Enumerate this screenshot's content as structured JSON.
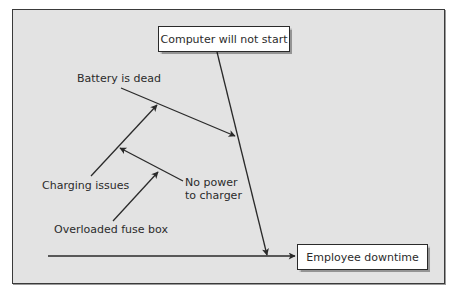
{
  "diagram": {
    "type": "cause-and-effect",
    "title": "",
    "effect_box": {
      "label": "Employee downtime"
    },
    "primary_cause_box": {
      "label": "Computer will not start"
    },
    "causes": [
      {
        "id": "battery",
        "label": "Battery is dead",
        "points_to": "Computer will not start"
      },
      {
        "id": "charging",
        "label": "Charging issues",
        "points_to": "Battery is dead"
      },
      {
        "id": "nopower",
        "label_line1": "No power",
        "label_line2": "to charger",
        "points_to": "Charging issues"
      },
      {
        "id": "fuse",
        "label": "Overloaded fuse box",
        "points_to": "No power to charger"
      }
    ],
    "colors": {
      "background": "#ffffff",
      "panel": "#e3e3e3",
      "line": "#2a2a2a",
      "box_fill": "#ffffff",
      "text": "#2b2b2b"
    }
  }
}
